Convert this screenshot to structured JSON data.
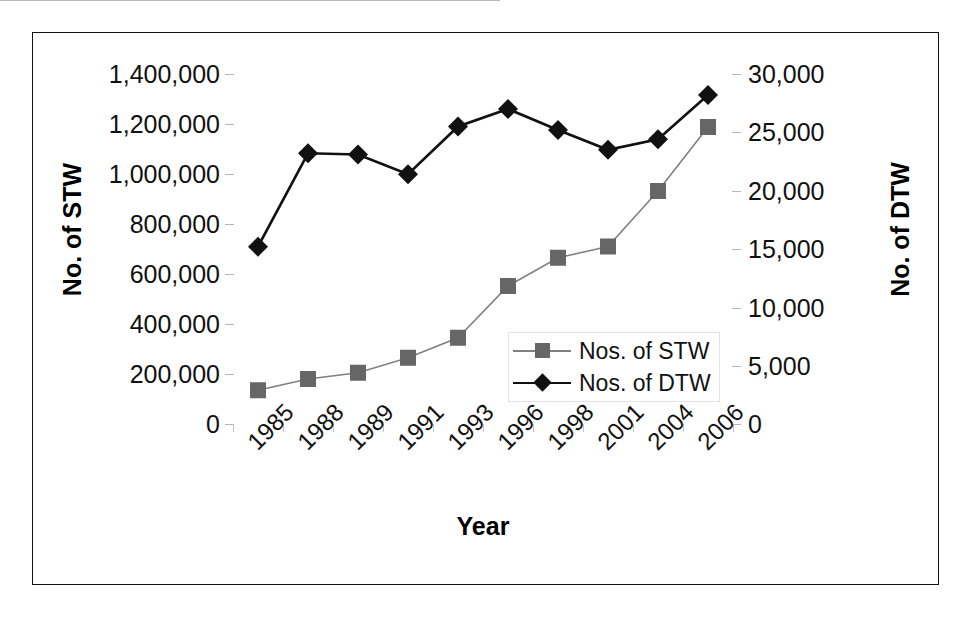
{
  "chart_data": {
    "type": "line",
    "title": "",
    "xlabel": "Year",
    "categories": [
      "1985",
      "1988",
      "1989",
      "1991",
      "1993",
      "1996",
      "1998",
      "2001",
      "2004",
      "2006"
    ],
    "grid": false,
    "legend_position": "center-right-inside",
    "axes": {
      "left": {
        "label": "No. of STW",
        "ticks": [
          "0",
          "200,000",
          "400,000",
          "600,000",
          "800,000",
          "1,000,000",
          "1,200,000",
          "1,400,000"
        ],
        "tick_values": [
          0,
          200000,
          400000,
          600000,
          800000,
          1000000,
          1200000,
          1400000
        ],
        "ylim": [
          0,
          1400000
        ]
      },
      "right": {
        "label": "No. of DTW",
        "ticks": [
          "0",
          "5,000",
          "10,000",
          "15,000",
          "20,000",
          "25,000",
          "30,000"
        ],
        "tick_values": [
          0,
          5000,
          10000,
          15000,
          20000,
          25000,
          30000
        ],
        "ylim": [
          0,
          30000
        ]
      }
    },
    "series": [
      {
        "name": "Nos. of STW",
        "legend_label": "Nos. of STW",
        "axis": "left",
        "marker": "square",
        "color": "#666666",
        "line_color": "#808080",
        "values": [
          135000,
          180000,
          205000,
          265000,
          345000,
          552000,
          665000,
          710000,
          932000,
          1188000
        ]
      },
      {
        "name": "Nos. of DTW",
        "legend_label": "Nos. of DTW",
        "axis": "right",
        "marker": "diamond",
        "color": "#111111",
        "line_color": "#111111",
        "values": [
          15200,
          23200,
          23100,
          21400,
          25500,
          27000,
          25200,
          23500,
          24400,
          28200
        ]
      }
    ]
  },
  "colors": {
    "frame": "#111111",
    "background": "#ffffff",
    "stw": "#666666",
    "dtw": "#111111",
    "axis": "#b8b8b8"
  }
}
